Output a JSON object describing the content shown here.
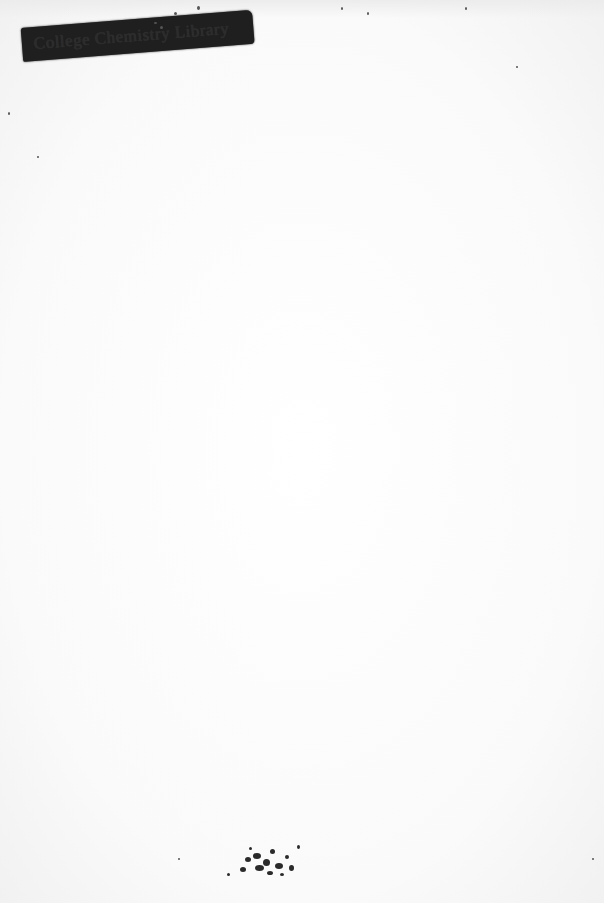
{
  "document": {
    "type": "scanned blank page",
    "stamp": {
      "text": "College Chemistry Library",
      "obscured": true,
      "bar_color": "#1f1f1f"
    },
    "background_color": "#fbfbfb",
    "marks": [
      {
        "name": "ink-smudge",
        "position": "bottom-center"
      },
      {
        "name": "specks",
        "position": "top-edge"
      }
    ]
  }
}
